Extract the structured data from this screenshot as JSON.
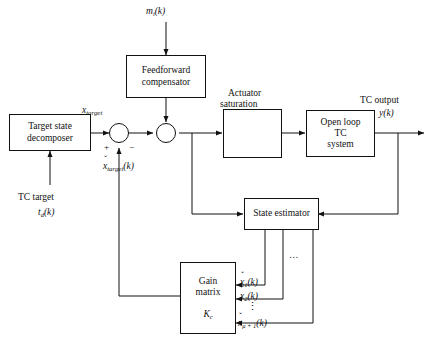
{
  "diagram": {
    "blocks": {
      "target_state_decomposer": {
        "line1": "Target state",
        "line2": "decomposer"
      },
      "feedforward_compensator": {
        "line1": "Feedforward",
        "line2": "compensator"
      },
      "actuator_saturation": {
        "line1": "Actuator",
        "line2": "saturation"
      },
      "open_loop_tc_system": {
        "line1": "Open loop",
        "line2": "TC",
        "line3": "system"
      },
      "state_estimator": {
        "line1": "State estimator"
      },
      "gain_matrix": {
        "line1": "Gain",
        "line2": "matrix",
        "symbol_base": "K",
        "symbol_sub": "c"
      }
    },
    "labels": {
      "disturbance_input": {
        "base": "m",
        "sub": "i",
        "arg": "(k)"
      },
      "x_target": {
        "base": "x",
        "sub": "target"
      },
      "x_target_hat": {
        "base": "x",
        "sub": "target",
        "arg": "(k)",
        "accent": "ˇ"
      },
      "tc_target_line1": "TC target",
      "tc_target_line2": {
        "base": "t",
        "sub": "d",
        "arg": "(k)"
      },
      "tc_output_line1": "TC output",
      "tc_output_line2": {
        "base": "y",
        "arg": "(k)"
      },
      "state_1": {
        "base": "x",
        "sub": "1",
        "arg": "(k)",
        "accent": "ˇ"
      },
      "state_2": {
        "base": "x",
        "sub": "2",
        "arg": "(k)",
        "accent": "ˇ"
      },
      "state_n": {
        "base": "x",
        "sub": "μ + 1",
        "arg": "(k)",
        "accent": "ˇ"
      },
      "state_ellipsis": "…",
      "vertical_ellipsis": "⋮",
      "sum_plus": "+",
      "sum_minus": "−"
    },
    "colors": {
      "stroke": "#111111",
      "background": "#ffffff",
      "text": "#111111"
    }
  }
}
